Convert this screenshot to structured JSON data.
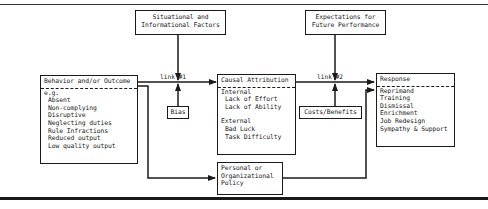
{
  "diagram": {
    "nodes": {
      "situational": {
        "lines": [
          "Situational and",
          "Informational Factors"
        ]
      },
      "expectations": {
        "lines": [
          "Expectations for",
          "Future Performance"
        ]
      },
      "behavior": {
        "title": "Behavior and/or Outcome",
        "intro": "e.g.",
        "items": [
          "Absent",
          "Non-complying",
          "Disruptive",
          "Neglecting duties",
          "Rule Infractions",
          "Reduced output",
          "Low quality output"
        ]
      },
      "causal": {
        "title": "Causal Attribution",
        "internal_label": "Internal",
        "internal_items": [
          "Lack of Effort",
          "Lack of Ability"
        ],
        "external_label": "External",
        "external_items": [
          "Bad Luck",
          "Task Difficulty"
        ]
      },
      "response": {
        "title": "Response",
        "items": [
          "Reprimand",
          "Training",
          "Dismissal",
          "Enrichment",
          "Job Redesign",
          "Sympathy & Support"
        ]
      },
      "bias": {
        "label": "Bias"
      },
      "costs": {
        "label": "Costs/Benefits"
      },
      "policy": {
        "lines": [
          "Personal or",
          "Organizational",
          "Policy"
        ]
      }
    },
    "edges": {
      "link1": {
        "label": "link #1"
      },
      "link2": {
        "label": "link #2"
      }
    }
  }
}
